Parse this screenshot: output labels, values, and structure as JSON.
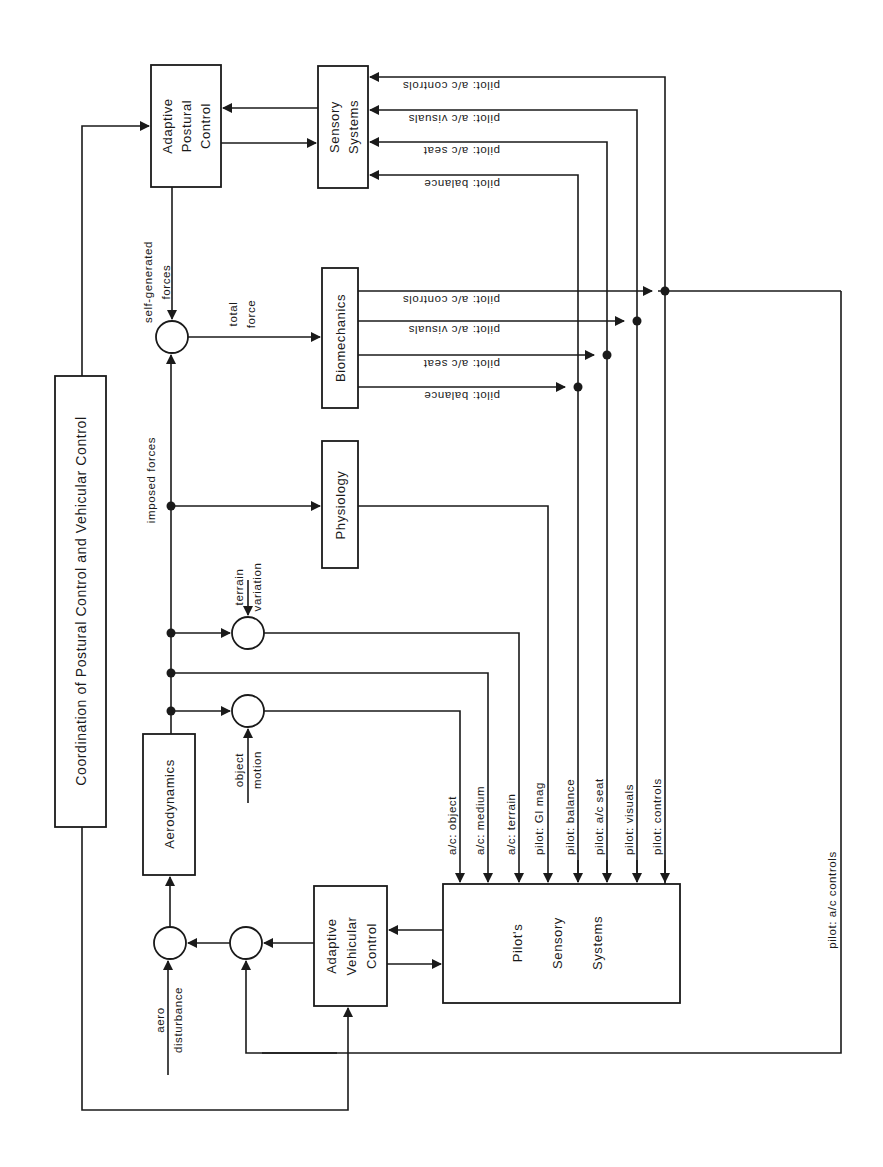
{
  "diagram": {
    "orientation": "rotated 90 degrees counter-clockwise",
    "blocks": {
      "coordination": "Coordination of Postural Control and Vehicular Control",
      "adaptive_postural": [
        "Adaptive",
        "Postural",
        "Control"
      ],
      "sensory_systems": [
        "Sensory",
        "Systems"
      ],
      "biomechanics": "Biomechanics",
      "physiology": "Physiology",
      "aerodynamics": "Aerodynamics",
      "adaptive_vehicular": [
        "Adaptive",
        "Vehicular",
        "Control"
      ],
      "pilots_sensory": [
        "Pilot's",
        "Sensory",
        "Systems"
      ]
    },
    "signals": {
      "self_generated": [
        "self-generated",
        "forces"
      ],
      "total_force": [
        "total",
        "force"
      ],
      "imposed_forces": "imposed  forces",
      "terrain_variation": [
        "terrain",
        "variation"
      ],
      "object_motion": [
        "object",
        "motion"
      ],
      "aero_disturbance": [
        "aero",
        "disturbance"
      ],
      "feedback_controls": "pilot:  a/c  controls"
    },
    "sensory_inputs": [
      "pilot:  a/c  controls",
      "pilot:  a/c  visuals",
      "pilot:  a/c  seat",
      "pilot:  balance"
    ],
    "biomech_outputs": [
      "pilot:  a/c  controls",
      "pilot:  a/c  visuals",
      "pilot:  a/c  seat",
      "pilot:  balance"
    ],
    "pilot_inputs": [
      "a/c:  object",
      "a/c:  medium",
      "a/c:  terrain",
      "pilot:  GI  mag",
      "pilot:  balance",
      "pilot:  a/c  seat",
      "pilot:  visuals",
      "pilot:  controls"
    ]
  }
}
